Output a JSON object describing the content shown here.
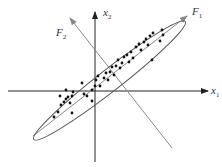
{
  "diagram": {
    "title": "",
    "labels": {
      "x1": "x",
      "x1_sub": "1",
      "x2": "x",
      "x2_sub": "2",
      "F1": "F",
      "F1_sub": "1",
      "F2": "F",
      "F2_sub": "2"
    },
    "colors": {
      "axis": "#222222",
      "principal_axis": "#888888",
      "ellipse": "#555555",
      "points": "#111111"
    },
    "points": [
      [
        54,
        117
      ],
      [
        58,
        112
      ],
      [
        61,
        105
      ],
      [
        64,
        102
      ],
      [
        66,
        99
      ],
      [
        68,
        97
      ],
      [
        70,
        103
      ],
      [
        72,
        96
      ],
      [
        73,
        92
      ],
      [
        66,
        90
      ],
      [
        60,
        96
      ],
      [
        87,
        96
      ],
      [
        82,
        83
      ],
      [
        84,
        94
      ],
      [
        92,
        90
      ],
      [
        95,
        86
      ],
      [
        96,
        80
      ],
      [
        98,
        76
      ],
      [
        100,
        86
      ],
      [
        104,
        78
      ],
      [
        106,
        73
      ],
      [
        108,
        80
      ],
      [
        110,
        72
      ],
      [
        112,
        67
      ],
      [
        114,
        75
      ],
      [
        116,
        66
      ],
      [
        118,
        60
      ],
      [
        120,
        68
      ],
      [
        122,
        63
      ],
      [
        124,
        57
      ],
      [
        127,
        55
      ],
      [
        129,
        62
      ],
      [
        131,
        52
      ],
      [
        133,
        58
      ],
      [
        136,
        47
      ],
      [
        139,
        44
      ],
      [
        141,
        50
      ],
      [
        144,
        42
      ],
      [
        146,
        39
      ],
      [
        148,
        45
      ],
      [
        150,
        36
      ],
      [
        153,
        33
      ],
      [
        160,
        41
      ],
      [
        163,
        35
      ],
      [
        162,
        30
      ],
      [
        152,
        60
      ],
      [
        72,
        113
      ],
      [
        92,
        101
      ]
    ]
  }
}
